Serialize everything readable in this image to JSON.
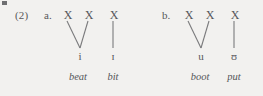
{
  "figure": {
    "example_number": "(2)",
    "groups": [
      {
        "label": "a.",
        "x_slots": [
          "X",
          "X",
          "X"
        ],
        "segments": [
          "i",
          "ɪ"
        ],
        "glosses": [
          "beat",
          "bit"
        ]
      },
      {
        "label": "b.",
        "x_slots": [
          "X",
          "X",
          "X"
        ],
        "segments": [
          "u",
          "ʊ"
        ],
        "glosses": [
          "boot",
          "put"
        ]
      }
    ],
    "colors": {
      "background": "#f2f1ef",
      "ink": "#55565a",
      "line": "#7a7a7c"
    }
  }
}
